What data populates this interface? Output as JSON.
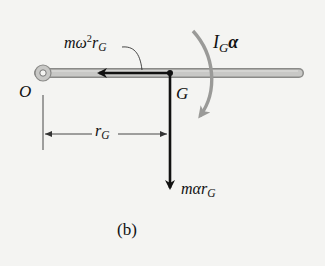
{
  "figure": {
    "caption": "(b)",
    "colors": {
      "background": "#f4f4f2",
      "bar_fill": "#c8c8c6",
      "bar_edge": "#8a8a88",
      "vector": "#111111",
      "moment_arrow": "#9a9a98",
      "dimension": "#333333"
    }
  },
  "labels": {
    "pivot": "O",
    "center_of_mass": "G",
    "normal_force": {
      "base": "mω",
      "sup": "2",
      "mid": "r",
      "sub": "G"
    },
    "tangential_force": {
      "base": "mαr",
      "sub": "G"
    },
    "moment": {
      "base": "I",
      "sub": "G",
      "tail": "α"
    },
    "distance": {
      "base": "r",
      "sub": "G"
    }
  },
  "geometry": {
    "bar": {
      "x1": 35,
      "x2": 303,
      "y": 73,
      "thickness": 9
    },
    "pivot": {
      "cx": 43,
      "cy": 73,
      "r_outer": 8,
      "r_inner": 3
    },
    "G": {
      "x": 170,
      "y": 73
    },
    "horizontal_vector_tip_x": 97,
    "vertical_vector_tip_y": 190,
    "dimension_y": 134
  }
}
